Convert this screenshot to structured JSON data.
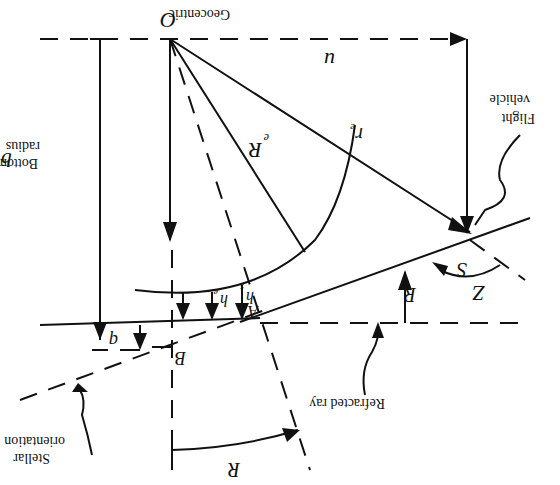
{
  "diagram": {
    "orientation": "rotated-180",
    "labels": {
      "origin": "O",
      "origin_desc": "Geocentric",
      "u": "u",
      "bottom_radius_line1": "Bottom",
      "bottom_radius_line2": "radius",
      "b": "b",
      "Re": "R",
      "Re_sub": "e",
      "re": "r",
      "re_sub": "e",
      "flight_vehicle_line1": "Flight",
      "flight_vehicle_line2": "vehicle",
      "S": "S",
      "Z": "Z",
      "R_right": "R",
      "A": "A",
      "hs": "h",
      "hs_sub": "s",
      "he": "h",
      "he_sub": "e",
      "q": "q",
      "B": "B",
      "refracted_ray": "Refracted ray",
      "stellar_line1": "Stellar",
      "stellar_line2": "orientation",
      "R_bottom": "R"
    }
  }
}
